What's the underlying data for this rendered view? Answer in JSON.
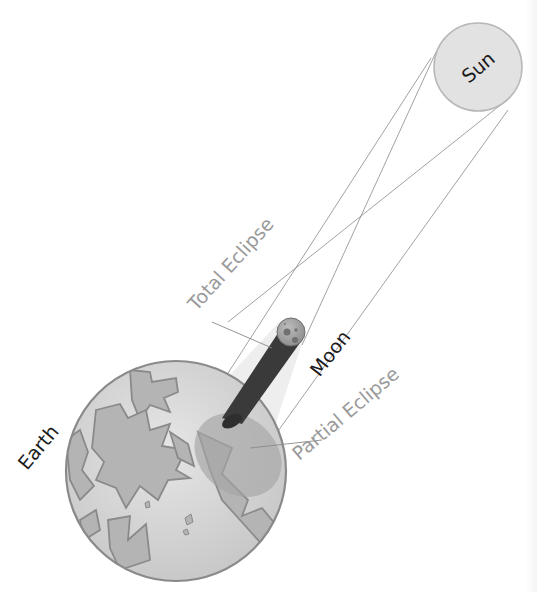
{
  "labels": {
    "sun": "Sun",
    "moon": "Moon",
    "earth": "Earth",
    "total_eclipse": "Total Eclipse",
    "partial_eclipse": "Partial Eclipse"
  },
  "colors": {
    "background": "#ffffff",
    "sun_fill": "#e2e2e2",
    "sun_stroke": "#b8b8b8",
    "earth_fill": "#d2d2d2",
    "earth_stroke": "#8a8a8a",
    "land_fill": "#b4b4b4",
    "penumbra_fill": "#ebebeb",
    "umbra_fill": "#3c3c3c",
    "partial_zone_fill": "#a8a8a8",
    "label_dark": "#1a1a1a",
    "label_light": "#909090",
    "ray_line": "#7a7a7a"
  },
  "diagram": {
    "objects": [
      {
        "name": "Sun",
        "cx": 478,
        "cy": 67,
        "r": 45
      },
      {
        "name": "Moon",
        "cx": 291,
        "cy": 332,
        "r": 14
      },
      {
        "name": "Earth",
        "cx": 176,
        "cy": 471,
        "r": 111
      }
    ]
  }
}
